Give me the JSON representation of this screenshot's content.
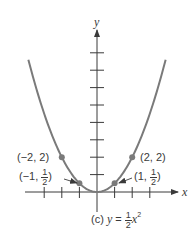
{
  "chart_data": {
    "type": "line",
    "caption": {
      "prefix": "(c)",
      "var_y": "y",
      "equals": "=",
      "frac_num": "1",
      "frac_den": "2",
      "var_x": "x",
      "exponent": "2"
    },
    "xlabel": "x",
    "ylabel": "y",
    "function": "y = 0.5 * x^2",
    "xlim": [
      -3,
      4
    ],
    "ylim": [
      0,
      8
    ],
    "x_ticks": [
      -3,
      -2,
      -1,
      1,
      2,
      3
    ],
    "y_ticks": [
      1,
      2,
      3,
      4,
      5,
      6,
      7,
      8
    ],
    "grid": false,
    "series": [
      {
        "name": "y = 1/2 x^2",
        "color": "#7a7a7a",
        "x": [
          -3.9,
          -3,
          -2,
          -1,
          0,
          1,
          2,
          3,
          3.9
        ],
        "y": [
          7.6,
          4.5,
          2,
          0.5,
          0,
          0.5,
          2,
          4.5,
          7.6
        ]
      }
    ],
    "points": [
      {
        "x": -2,
        "y": 2,
        "label": "(−2, 2)"
      },
      {
        "x": -1,
        "y": 0.5,
        "label_prefix": "(−1,",
        "frac_num": "1",
        "frac_den": "2",
        "label_suffix": ")"
      },
      {
        "x": 1,
        "y": 0.5,
        "label_prefix": "(1,",
        "frac_num": "1",
        "frac_den": "2",
        "label_suffix": ")"
      },
      {
        "x": 2,
        "y": 2,
        "label": "(2, 2)"
      }
    ],
    "colors": {
      "axis": "#3a3a3a",
      "curve": "#7a7a7a",
      "point": "#7a7a7a"
    }
  }
}
